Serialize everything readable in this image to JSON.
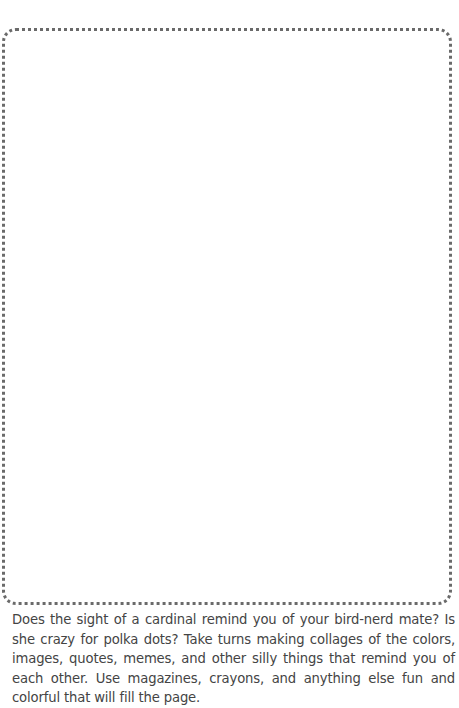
{
  "page": {
    "frame": {
      "style": "dotted",
      "color": "#6a6a6a",
      "content": ""
    },
    "prompt_text": "Does the sight of a cardinal remind you of your bird-nerd mate? Is she crazy for polka dots? Take turns making collages of the colors, images, quotes, memes, and other silly things that remind you of each other. Use magazines, crayons, and anything else fun and colorful that will fill the page."
  }
}
